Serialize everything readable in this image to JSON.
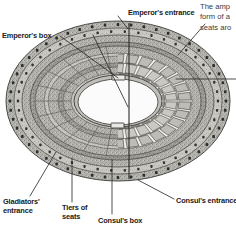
{
  "figure": {
    "view": "oblique elliptical plan with cutaway",
    "arena_color": "#fbfbfb",
    "stone_color": "#9a9a96",
    "stone_light": "#c3c2bd",
    "stone_mid": "#adaca7",
    "stone_dark": "#6d6c69",
    "outline_color": "#2a2a28",
    "leader_color": "#232323",
    "background": "#ffffff"
  },
  "callouts": [
    {
      "id": "emperors-box",
      "label": "Emperor's box"
    },
    {
      "id": "emperors-entrance",
      "label": "Emperor's entrance"
    },
    {
      "id": "gladiators-entrance",
      "label": "Gladiators'\nentrance"
    },
    {
      "id": "tiers-of-seats",
      "label": "Tiers of\nseats"
    },
    {
      "id": "consuls-box",
      "label": "Consul's box"
    },
    {
      "id": "consuls-entrance",
      "label": "Consul's entrance"
    }
  ],
  "body_text": {
    "clipped_paragraph": "The amp\nform of a\nseats aro"
  }
}
